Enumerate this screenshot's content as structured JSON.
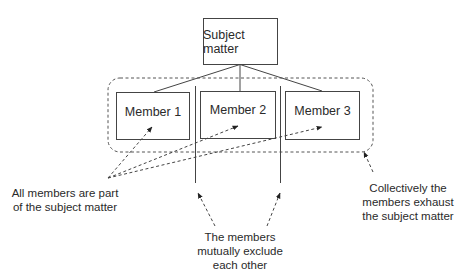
{
  "diagram": {
    "root": {
      "label": "Subject matter"
    },
    "members": [
      {
        "label": "Member 1"
      },
      {
        "label": "Member 2"
      },
      {
        "label": "Member 3"
      }
    ],
    "annotations": {
      "part_of": {
        "line1": "All members are part",
        "line2": "of the subject matter"
      },
      "exclusive": {
        "line1": "The members",
        "line2": "mutually exclude",
        "line3": "each other"
      },
      "exhaustive": {
        "line1": "Collectively the",
        "line2": "members exhaust",
        "line3": "the subject matter"
      }
    },
    "colors": {
      "stroke": "#444444",
      "text": "#2a2a2a",
      "background": "#ffffff"
    }
  }
}
